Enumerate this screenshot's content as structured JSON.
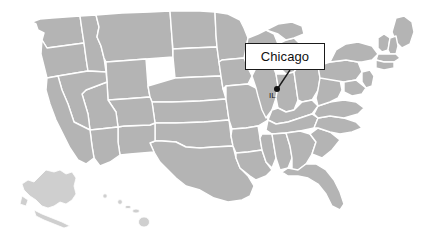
{
  "figure": {
    "type": "map",
    "region": "United States",
    "background_color": "#ffffff",
    "state_fill_color": "#b4b4b4",
    "state_border_color": "#ffffff",
    "inset_fill_color": "#cfcfcf"
  },
  "callout": {
    "label": "Chicago",
    "box_fill": "#ffffff",
    "box_border_color": "#1a1a1a",
    "leader_color": "#1a1a1a"
  },
  "marker": {
    "name": "Chicago",
    "state_abbr": "IL",
    "dot_color": "#111111",
    "x": 277,
    "y": 89
  },
  "insets": [
    {
      "name": "Alaska"
    },
    {
      "name": "Hawaii"
    }
  ]
}
